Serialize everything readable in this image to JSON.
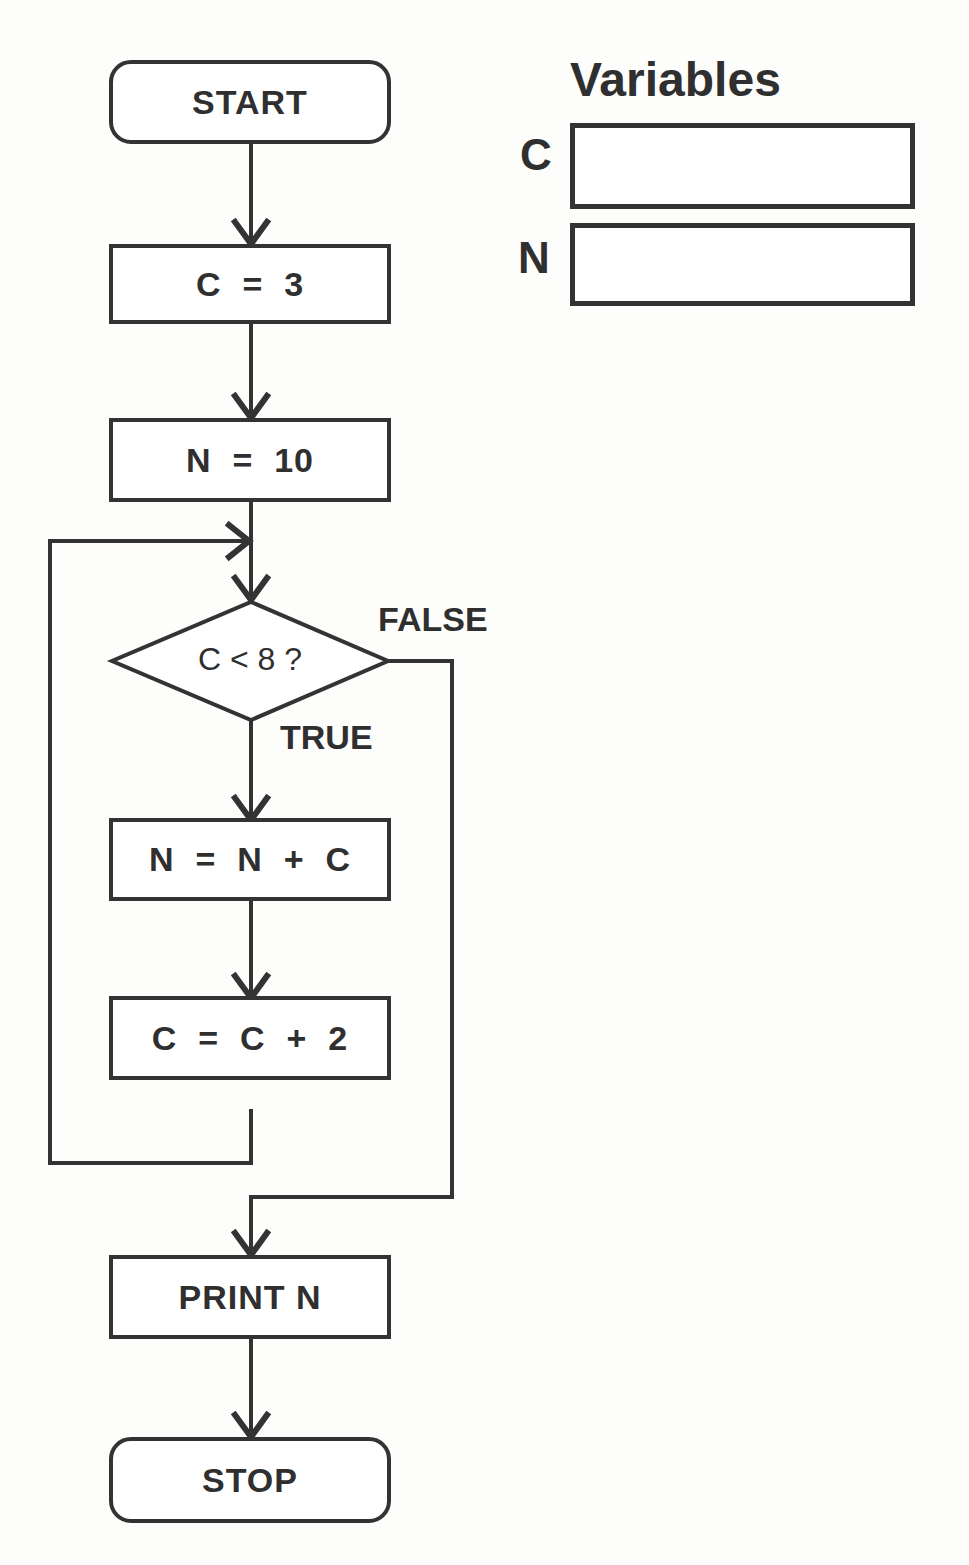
{
  "flowchart": {
    "start": "START",
    "step1": "C  =  3",
    "step2": "N  =  10",
    "decision": "C < 8 ?",
    "false_label": "FALSE",
    "true_label": "TRUE",
    "loop_step1": "N  =  N  +  C",
    "loop_step2": "C  =  C  +  2",
    "output": "PRINT N",
    "stop": "STOP"
  },
  "variables": {
    "title": "Variables",
    "items": [
      {
        "name": "C",
        "value": ""
      },
      {
        "name": "N",
        "value": ""
      }
    ]
  },
  "colors": {
    "stroke": "#333333",
    "text": "#2f2f2f",
    "background": "#fdfdfc"
  }
}
